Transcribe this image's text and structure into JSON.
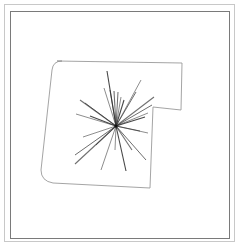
{
  "diagram": {
    "type": "floorplan-with-scan-rays",
    "colors": {
      "background": "#ffffff",
      "outer_frame": "#c8c8c8",
      "inner_frame": "#7a7a7a",
      "outline": "#9a9a9a",
      "rays": "#333333"
    },
    "outline_path": "M 57 61 L 182 63 L 181 110 L 153 107 L 150 188 L 53 183 Q 41 181 41 170 L 52 70 Q 53 61 62 61 Z",
    "center": [
      116,
      126
    ],
    "rays": [
      [
        107,
        71
      ],
      [
        104,
        88
      ],
      [
        110,
        90
      ],
      [
        114,
        91
      ],
      [
        118,
        92
      ],
      [
        121,
        97
      ],
      [
        124,
        100
      ],
      [
        141,
        80
      ],
      [
        136,
        92
      ],
      [
        154,
        97
      ],
      [
        152,
        105
      ],
      [
        148,
        113
      ],
      [
        145,
        117
      ],
      [
        148,
        133
      ],
      [
        140,
        131
      ],
      [
        80,
        100
      ],
      [
        85,
        103
      ],
      [
        76,
        114
      ],
      [
        90,
        116
      ],
      [
        83,
        137
      ],
      [
        75,
        155
      ],
      [
        75,
        164
      ],
      [
        96,
        145
      ],
      [
        101,
        170
      ],
      [
        126,
        171
      ],
      [
        115,
        150
      ],
      [
        146,
        160
      ],
      [
        132,
        150
      ]
    ]
  }
}
